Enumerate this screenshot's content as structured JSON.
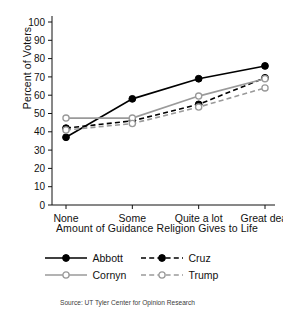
{
  "chart_data": {
    "type": "line",
    "title": "",
    "xlabel": "Amount of Guidance Religion Gives to Life",
    "ylabel": "Percent of Voters",
    "categories": [
      "None",
      "Some",
      "Quite a lot",
      "Great deal"
    ],
    "ylim": [
      0,
      100
    ],
    "yticks": [
      0,
      10,
      20,
      30,
      40,
      50,
      60,
      70,
      80,
      90,
      100
    ],
    "grid": false,
    "legend_position": "bottom",
    "series": [
      {
        "name": "Abbott",
        "values": [
          37,
          58,
          69,
          76
        ],
        "color": "#000000",
        "line_style": "solid",
        "marker": "filled-circle"
      },
      {
        "name": "Cruz",
        "values": [
          42,
          46,
          55,
          69.5
        ],
        "color": "#000000",
        "line_style": "dashed",
        "marker": "filled-circle"
      },
      {
        "name": "Cornyn",
        "values": [
          47.5,
          47.5,
          59.5,
          69
        ],
        "color": "#9a9a9a",
        "line_style": "solid",
        "marker": "open-circle"
      },
      {
        "name": "Trump",
        "values": [
          41,
          44.5,
          53.5,
          64
        ],
        "color": "#9a9a9a",
        "line_style": "dashed",
        "marker": "open-circle"
      }
    ],
    "source": "Source: UT Tyler Center for Opinion Research"
  },
  "axes": {
    "y_title": "Percent of Voters",
    "x_title": "Amount of Guidance Religion Gives to Life",
    "y_tick_labels": [
      "0",
      "10",
      "20",
      "30",
      "40",
      "50",
      "60",
      "70",
      "80",
      "90",
      "100"
    ],
    "x_tick_labels": [
      "None",
      "Some",
      "Quite a lot",
      "Great deal"
    ]
  },
  "legend": {
    "items": [
      {
        "label": "Abbott"
      },
      {
        "label": "Cruz"
      },
      {
        "label": "Cornyn"
      },
      {
        "label": "Trump"
      }
    ]
  },
  "footer": {
    "source": "Source: UT Tyler Center for Opinion Research"
  }
}
